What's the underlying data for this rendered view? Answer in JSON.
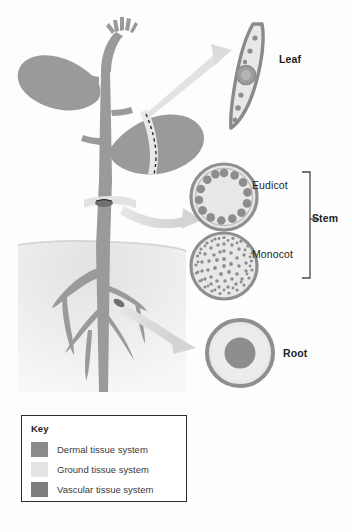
{
  "figure": {
    "callouts": [
      {
        "id": "leaf",
        "label": "Leaf"
      },
      {
        "id": "eudicot",
        "label": "Eudicot"
      },
      {
        "id": "monocot",
        "label": "Monocot"
      },
      {
        "id": "stem",
        "label": "Stem"
      },
      {
        "id": "root",
        "label": "Root"
      }
    ]
  },
  "key": {
    "title": "Key",
    "items": [
      {
        "label": "Dermal tissue system",
        "color": "#8a8a8a"
      },
      {
        "label": "Ground tissue system",
        "color": "#e3e3e3"
      },
      {
        "label": "Vascular tissue system",
        "color": "#7e7e7e"
      }
    ]
  },
  "colors": {
    "dermal": "#8a8a8a",
    "ground": "#e3e3e3",
    "vascular": "#7e7e7e",
    "plant_body": "#9a9a9a",
    "plant_outline": "#7f7f7f",
    "soil": "#ededed",
    "arrow": "#d8d8d8",
    "text": "#231f20",
    "bracket": "#4a4a4a",
    "background": "#fdfdfd"
  },
  "cross_sections": {
    "leaf": {
      "name": "leaf-cross-section",
      "description": "crescent blade with epidermis outline, ground tissue interior, scattered vascular dots and a central midrib bundle",
      "dot_count": 8
    },
    "eudicot_stem": {
      "name": "eudicot-stem-cross-section",
      "description": "circular stem with a single ring of vascular bundles near the perimeter",
      "bundle_count": 13
    },
    "monocot_stem": {
      "name": "monocot-stem-cross-section",
      "description": "circular stem with vascular bundles scattered throughout the ground tissue",
      "bundle_count": 78
    },
    "root": {
      "name": "root-cross-section",
      "description": "circular root with dermal ring, ground cortex, and a solid central vascular cylinder"
    }
  }
}
